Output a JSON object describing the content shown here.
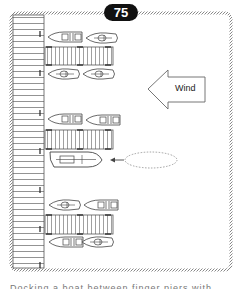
{
  "figure": {
    "badge_number": "75",
    "wind_label": "Wind",
    "wind_direction": "left",
    "caption_partial": "Docking a boat between finger piers with wind from the side",
    "colors": {
      "badge_bg": "#111111",
      "badge_text": "#ffffff",
      "line": "#555555",
      "rope_border": "#8a8a8a",
      "background": "#ffffff"
    },
    "finger_piers": [
      {
        "id": "top",
        "boats_above": 2,
        "boats_below": 2
      },
      {
        "id": "middle",
        "boats_above": 2,
        "boats_below": 1,
        "docking_boat": true
      },
      {
        "id": "bottom",
        "boats_above": 2,
        "boats_below": 2
      }
    ]
  }
}
